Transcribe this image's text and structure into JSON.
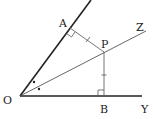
{
  "diagram": {
    "type": "geometry",
    "colors": {
      "side_line": "#222222",
      "bisector_line": "#555555",
      "perp_line": "#666666",
      "label": "#222222"
    },
    "points": {
      "O": {
        "label": "O",
        "x": 20,
        "y": 96
      },
      "A": {
        "label": "A",
        "x": 70,
        "y": 28
      },
      "P": {
        "label": "P",
        "x": 104,
        "y": 52
      },
      "B": {
        "label": "B",
        "x": 104,
        "y": 96
      },
      "Z": {
        "label": "Z",
        "x": 146,
        "y": 31
      },
      "Y": {
        "label": "Y",
        "x": 142,
        "y": 96
      }
    },
    "labels": {
      "O": "O",
      "A": "A",
      "P": "P",
      "B": "B",
      "Z": "Z",
      "Y": "Y"
    },
    "marks": {
      "right_angles": [
        "A",
        "B"
      ],
      "equal_segments": [
        "AP",
        "PB"
      ],
      "equal_angles": [
        "AOP",
        "POB"
      ]
    }
  }
}
